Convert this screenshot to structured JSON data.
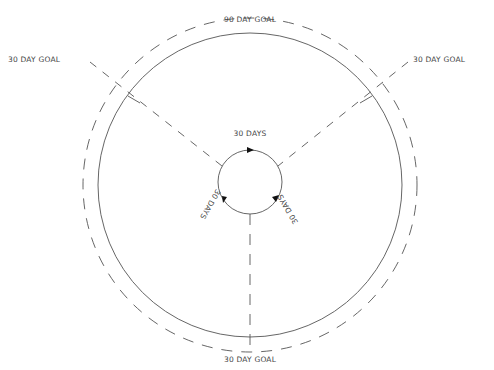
{
  "diagram": {
    "outer_label": "90 DAY GOAL",
    "goals": [
      {
        "label": "30 DAY GOAL",
        "position": "top-left"
      },
      {
        "label": "30 DAY GOAL",
        "position": "top-right"
      },
      {
        "label": "30 DAY GOAL",
        "position": "bottom"
      }
    ],
    "cycle_labels": [
      {
        "label": "30 DAYS",
        "position": "top"
      },
      {
        "label": "30 DAYS",
        "position": "right"
      },
      {
        "label": "30 DAYS",
        "position": "left"
      }
    ],
    "colors": {
      "line": "#555555",
      "text": "#444444",
      "background": "#ffffff"
    }
  }
}
